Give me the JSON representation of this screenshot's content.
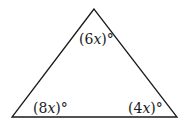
{
  "diagram": {
    "type": "triangle",
    "vertices": {
      "apex": [
        94,
        9
      ],
      "bottom_left": [
        12,
        117
      ],
      "bottom_right": [
        177,
        117
      ]
    },
    "stroke_color": "#1a1a1a",
    "angles": [
      {
        "position": "top",
        "open": "(",
        "coef": "6",
        "var": "x",
        "close": ")",
        "unit": "°"
      },
      {
        "position": "bottom-left",
        "open": "(",
        "coef": "8",
        "var": "x",
        "close": ")",
        "unit": "°"
      },
      {
        "position": "bottom-right",
        "open": "(",
        "coef": "4",
        "var": "x",
        "close": ")",
        "unit": "°"
      }
    ]
  }
}
